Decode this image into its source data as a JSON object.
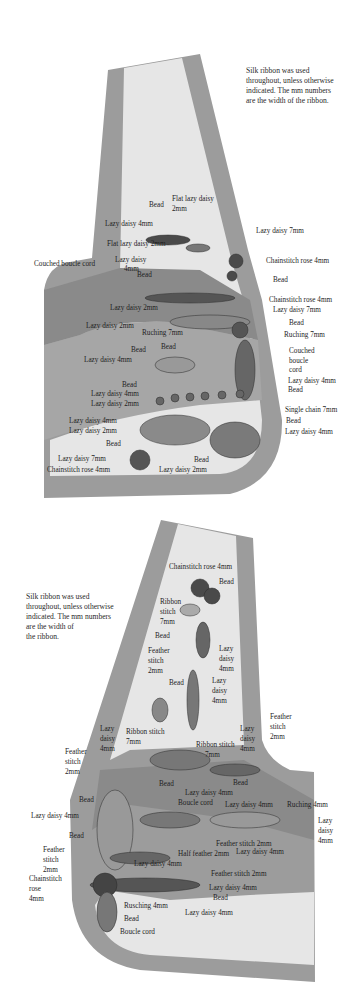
{
  "diagram_1": {
    "note": [
      "Silk ribbon was used",
      "throughout, unless otherwise",
      "indicated.  The mm numbers",
      "are the  width of the ribbon."
    ],
    "labels": [
      {
        "text": "Bead",
        "x": 149,
        "y": 207
      },
      {
        "text": "Flat lazy daisy",
        "x": 172,
        "y": 201
      },
      {
        "text": "2mm",
        "x": 172,
        "y": 211
      },
      {
        "text": "Lazy daisy 4mm",
        "x": 105,
        "y": 226
      },
      {
        "text": "Lazy daisy 7mm",
        "x": 256,
        "y": 233
      },
      {
        "text": "Flat lazy daisy 2mm",
        "x": 107,
        "y": 246
      },
      {
        "text": "Couched boucle cord",
        "x": 34,
        "y": 266
      },
      {
        "text": "Lazy daisy",
        "x": 115,
        "y": 262
      },
      {
        "text": "4mm",
        "x": 124,
        "y": 271
      },
      {
        "text": "Bead",
        "x": 137,
        "y": 277
      },
      {
        "text": "Chainstitch rose 4mm",
        "x": 266,
        "y": 263
      },
      {
        "text": "Bead",
        "x": 273,
        "y": 282
      },
      {
        "text": "Lazy daisy 2mm",
        "x": 110,
        "y": 310
      },
      {
        "text": "Chainstitch rose 4mm",
        "x": 269,
        "y": 302
      },
      {
        "text": "Lazy daisy 7mm",
        "x": 273,
        "y": 312
      },
      {
        "text": "Lazy daisy 2mm",
        "x": 86,
        "y": 328
      },
      {
        "text": "Ruching 7mm",
        "x": 142,
        "y": 335
      },
      {
        "text": "Bead",
        "x": 289,
        "y": 325
      },
      {
        "text": "Ruching 7mm",
        "x": 284,
        "y": 337
      },
      {
        "text": "Bead",
        "x": 131,
        "y": 352
      },
      {
        "text": "Bead",
        "x": 161,
        "y": 349
      },
      {
        "text": "Couched",
        "x": 289,
        "y": 353
      },
      {
        "text": "boucle",
        "x": 289,
        "y": 363
      },
      {
        "text": "cord",
        "x": 289,
        "y": 372
      },
      {
        "text": "Lazy daisy 4mm",
        "x": 84,
        "y": 362
      },
      {
        "text": "Lazy daisy 4mm",
        "x": 288,
        "y": 383
      },
      {
        "text": "Bead",
        "x": 288,
        "y": 392
      },
      {
        "text": "Bead",
        "x": 122,
        "y": 387
      },
      {
        "text": "Lazy daisy 4mm",
        "x": 91,
        "y": 396
      },
      {
        "text": "Lazy daisy 2mm",
        "x": 91,
        "y": 406
      },
      {
        "text": "Single chain 7mm",
        "x": 285,
        "y": 412
      },
      {
        "text": "Lazy daisy 4mm",
        "x": 69,
        "y": 423
      },
      {
        "text": "Bead",
        "x": 286,
        "y": 423
      },
      {
        "text": "Lazy daisy 2mm",
        "x": 69,
        "y": 433
      },
      {
        "text": "Lazy daisy 4mm",
        "x": 285,
        "y": 434
      },
      {
        "text": "Bead",
        "x": 106,
        "y": 446
      },
      {
        "text": "Lazy daisy 7mm",
        "x": 58,
        "y": 461
      },
      {
        "text": "Bead",
        "x": 194,
        "y": 462
      },
      {
        "text": "Chainstitch rose 4mm",
        "x": 47,
        "y": 472
      },
      {
        "text": "Lazy daisy 2mm",
        "x": 159,
        "y": 472
      }
    ]
  },
  "diagram_2": {
    "note": [
      "Silk ribbon was used",
      "throughout, unless otherwise",
      "indicated.  The mm numbers",
      " are the width of",
      "the ribbon."
    ],
    "labels": [
      {
        "text": "Chainstitch rose 4mm",
        "x": 169,
        "y": 569
      },
      {
        "text": "Bead",
        "x": 219,
        "y": 584
      },
      {
        "text": "Ribbon",
        "x": 160,
        "y": 604
      },
      {
        "text": "stitch",
        "x": 160,
        "y": 614
      },
      {
        "text": "7mm",
        "x": 160,
        "y": 624
      },
      {
        "text": "Bead",
        "x": 155,
        "y": 638
      },
      {
        "text": "Feather",
        "x": 148,
        "y": 653
      },
      {
        "text": "Lazy",
        "x": 219,
        "y": 651
      },
      {
        "text": "stitch",
        "x": 148,
        "y": 663
      },
      {
        "text": "daisy",
        "x": 219,
        "y": 661
      },
      {
        "text": "2mm",
        "x": 148,
        "y": 673
      },
      {
        "text": "4mm",
        "x": 219,
        "y": 671
      },
      {
        "text": "Bead",
        "x": 169,
        "y": 685
      },
      {
        "text": "Lazy",
        "x": 212,
        "y": 683
      },
      {
        "text": "daisy",
        "x": 212,
        "y": 693
      },
      {
        "text": "4mm",
        "x": 212,
        "y": 703
      },
      {
        "text": "Feather",
        "x": 270,
        "y": 719
      },
      {
        "text": "stitch",
        "x": 270,
        "y": 729
      },
      {
        "text": "2mm",
        "x": 270,
        "y": 739
      },
      {
        "text": "Lazy",
        "x": 100,
        "y": 731
      },
      {
        "text": "daisy",
        "x": 100,
        "y": 741
      },
      {
        "text": "4mm",
        "x": 100,
        "y": 751
      },
      {
        "text": "Ribbon stitch",
        "x": 126,
        "y": 734
      },
      {
        "text": "7mm",
        "x": 126,
        "y": 744
      },
      {
        "text": "Ribbon stitch",
        "x": 196,
        "y": 747
      },
      {
        "text": "7mm",
        "x": 205,
        "y": 757
      },
      {
        "text": "Lazy",
        "x": 240,
        "y": 731
      },
      {
        "text": "daisy",
        "x": 240,
        "y": 741
      },
      {
        "text": "4mm",
        "x": 240,
        "y": 751
      },
      {
        "text": "Feather",
        "x": 65,
        "y": 754
      },
      {
        "text": "stitch",
        "x": 65,
        "y": 764
      },
      {
        "text": "2mm",
        "x": 65,
        "y": 774
      },
      {
        "text": "Bead",
        "x": 159,
        "y": 786
      },
      {
        "text": "Bead",
        "x": 233,
        "y": 785
      },
      {
        "text": "Lazy daisy 4mm",
        "x": 185,
        "y": 795
      },
      {
        "text": "Bead",
        "x": 79,
        "y": 802
      },
      {
        "text": "Boucle cord",
        "x": 178,
        "y": 805
      },
      {
        "text": "Lazy daisy 4mm",
        "x": 225,
        "y": 807
      },
      {
        "text": "Ruching 4mm",
        "x": 287,
        "y": 807
      },
      {
        "text": "Lazy daisy 4mm",
        "x": 31,
        "y": 818
      },
      {
        "text": "Lazy",
        "x": 318,
        "y": 823
      },
      {
        "text": "daisy",
        "x": 318,
        "y": 833
      },
      {
        "text": "4mm",
        "x": 318,
        "y": 843
      },
      {
        "text": "Bead",
        "x": 69,
        "y": 838
      },
      {
        "text": "Feather stitch 2mm",
        "x": 216,
        "y": 846
      },
      {
        "text": "Feather",
        "x": 43,
        "y": 852
      },
      {
        "text": "Half feather 2mm",
        "x": 178,
        "y": 856
      },
      {
        "text": "Lazy daisy 4mm",
        "x": 236,
        "y": 854
      },
      {
        "text": "stitch",
        "x": 43,
        "y": 862
      },
      {
        "text": "Lazy daisy 4mm",
        "x": 134,
        "y": 866
      },
      {
        "text": "2mm",
        "x": 43,
        "y": 872
      },
      {
        "text": "Feather stitch 2mm",
        "x": 211,
        "y": 876
      },
      {
        "text": "Chainstitch",
        "x": 29,
        "y": 881
      },
      {
        "text": "rose",
        "x": 29,
        "y": 891
      },
      {
        "text": "Lazy daisy 4mm",
        "x": 209,
        "y": 890
      },
      {
        "text": "4mm",
        "x": 29,
        "y": 901
      },
      {
        "text": "Bead",
        "x": 213,
        "y": 900
      },
      {
        "text": "Rusching 4mm",
        "x": 124,
        "y": 908
      },
      {
        "text": "Lazy daisy 4mm",
        "x": 185,
        "y": 915
      },
      {
        "text": "Bead",
        "x": 124,
        "y": 921
      },
      {
        "text": "Boucle cord",
        "x": 120,
        "y": 934
      }
    ]
  },
  "colors": {
    "dark_band": "#8f8f8f",
    "mid_band": "#a8a8a8",
    "light_fill": "#e6e6e6",
    "outer_fill": "#9c9c9c",
    "stitch": "#4a4a4a"
  }
}
